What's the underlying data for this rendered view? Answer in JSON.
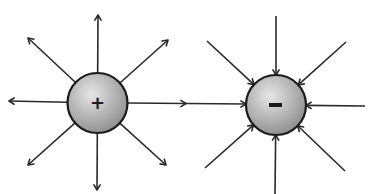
{
  "colors": {
    "line": "#2a2a2a",
    "charge_outline": "#1a1a1a",
    "charge_fill_light": "#e6e6e6",
    "charge_fill_dark": "#8c8c8c",
    "background": "#ffffff"
  },
  "charges": [
    {
      "id": "positive",
      "sign": "+",
      "field_direction": "outward",
      "line_count": 8
    },
    {
      "id": "negative",
      "sign": "-",
      "field_direction": "inward",
      "line_count": 8
    }
  ],
  "connecting_line": {
    "from": "positive",
    "to": "negative",
    "direction": "positive-to-negative"
  }
}
